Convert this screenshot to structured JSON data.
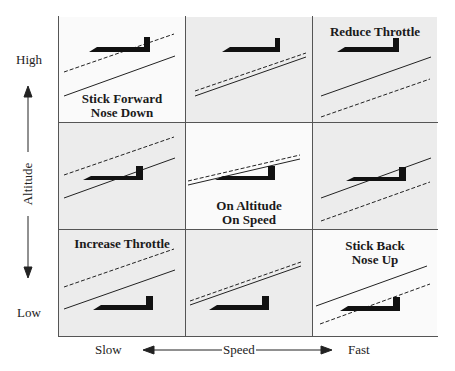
{
  "axes": {
    "y_label": "Altitude",
    "y_high": "High",
    "y_low": "Low",
    "x_label": "Speed",
    "x_slow": "Slow",
    "x_fast": "Fast"
  },
  "cells": [
    {
      "row": 0,
      "col": 0,
      "label_line1": "Stick Forward",
      "label_line2": "Nose Down",
      "shade": "white"
    },
    {
      "row": 0,
      "col": 1,
      "label_line1": "",
      "label_line2": "",
      "shade": "gray"
    },
    {
      "row": 0,
      "col": 2,
      "label_line1": "Reduce Throttle",
      "label_line2": "",
      "shade": "gray"
    },
    {
      "row": 1,
      "col": 0,
      "label_line1": "",
      "label_line2": "",
      "shade": "gray"
    },
    {
      "row": 1,
      "col": 1,
      "label_line1": "On Altitude",
      "label_line2": "On Speed",
      "shade": "white"
    },
    {
      "row": 1,
      "col": 2,
      "label_line1": "",
      "label_line2": "",
      "shade": "gray"
    },
    {
      "row": 2,
      "col": 0,
      "label_line1": "Increase Throttle",
      "label_line2": "",
      "shade": "gray"
    },
    {
      "row": 2,
      "col": 1,
      "label_line1": "",
      "label_line2": "",
      "shade": "gray"
    },
    {
      "row": 2,
      "col": 2,
      "label_line1": "Stick Back",
      "label_line2": "Nose Up",
      "shade": "white"
    }
  ]
}
